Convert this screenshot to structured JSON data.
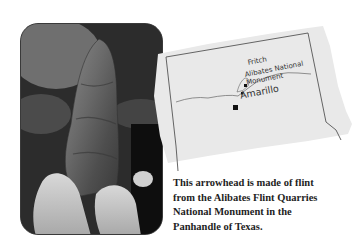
{
  "photo": {
    "subject": "arrowhead held between fingers",
    "alt": "Flint arrowhead"
  },
  "map": {
    "region": "Texas Panhandle",
    "places": [
      {
        "name": "Fritch",
        "marker": "square-small"
      },
      {
        "name": "Alibates National Monument",
        "line1": "Alibates National",
        "line2": "Monument",
        "marker": "square-small"
      },
      {
        "name": "Amarillo",
        "marker": "square-large"
      }
    ]
  },
  "caption": {
    "lines": [
      "This arrowhead is made of flint",
      "from the Alibates Flint Quarries",
      "National Monument in the",
      "Panhandle of Texas."
    ]
  },
  "colors": {
    "map_paper": "#e9e9e9",
    "map_lines": "#555555",
    "caption_text": "#1e1e1e"
  }
}
